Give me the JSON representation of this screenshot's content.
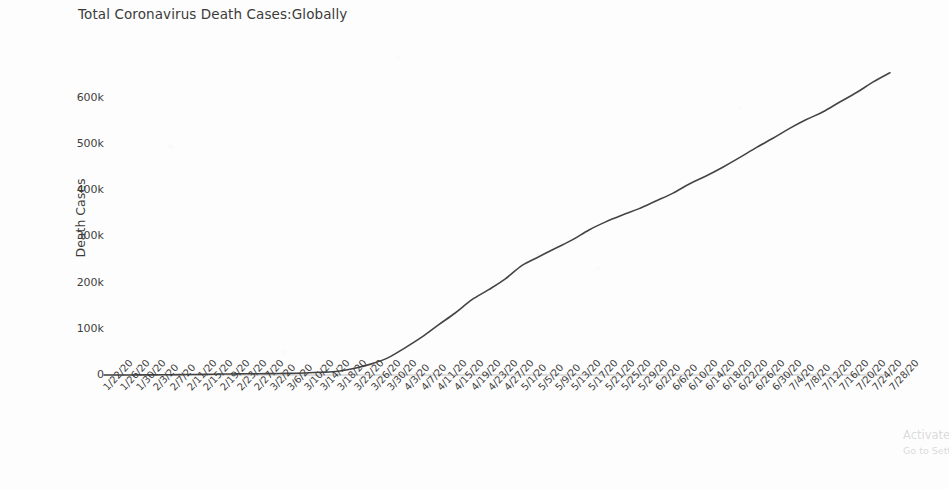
{
  "chart_data": {
    "type": "line",
    "title": "Total Coronavirus Death Cases:Globally",
    "xlabel": "",
    "ylabel": "Death Cases",
    "ylim": [
      0,
      660000
    ],
    "yticks": [
      0,
      100000,
      200000,
      300000,
      400000,
      500000,
      600000
    ],
    "ytick_labels": [
      "0",
      "100k",
      "200k",
      "300k",
      "400k",
      "500k",
      "600k"
    ],
    "grid": false,
    "legend": "none",
    "line_color": "#444444",
    "categories": [
      "1/22/20",
      "1/26/20",
      "1/30/20",
      "2/3/20",
      "2/7/20",
      "2/11/20",
      "2/15/20",
      "2/19/20",
      "2/23/20",
      "2/27/20",
      "3/2/20",
      "3/6/20",
      "3/10/20",
      "3/14/20",
      "3/18/20",
      "3/22/20",
      "3/26/20",
      "3/30/20",
      "4/3/20",
      "4/7/20",
      "4/11/20",
      "4/15/20",
      "4/19/20",
      "4/23/20",
      "4/27/20",
      "5/1/20",
      "5/5/20",
      "5/9/20",
      "5/13/20",
      "5/17/20",
      "5/21/20",
      "5/25/20",
      "5/29/20",
      "6/2/20",
      "6/6/20",
      "6/10/20",
      "6/14/20",
      "6/18/20",
      "6/22/20",
      "6/26/20",
      "6/30/20",
      "7/4/20",
      "7/8/20",
      "7/12/20",
      "7/16/20",
      "7/20/20",
      "7/24/20",
      "7/28/20"
    ],
    "values": [
      17,
      56,
      170,
      362,
      638,
      1016,
      1383,
      2009,
      2458,
      2810,
      3044,
      3460,
      4292,
      5833,
      8272,
      14641,
      24090,
      37582,
      58787,
      81865,
      108502,
      134177,
      162956,
      184643,
      208131,
      237366,
      255863,
      274361,
      292370,
      313900,
      331360,
      346215,
      360023,
      376488,
      393079,
      413328,
      430648,
      449631,
      470272,
      492070,
      512312,
      533619,
      552745,
      569636,
      590810,
      611278,
      634194,
      654036
    ],
    "series_name": "Total Death Cases",
    "x_tick_rotation": -47,
    "plot_area": {
      "left_px": 104,
      "right_px": 890,
      "top_px": 70,
      "bottom_px": 375
    }
  },
  "watermark": {
    "line1": "Activate Windows",
    "line2": "Go to Settings to activate Windows."
  }
}
